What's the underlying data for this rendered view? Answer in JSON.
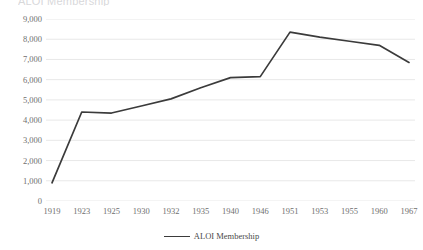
{
  "chart_title_partial": "ALOI Membership",
  "legend": {
    "entries": [
      {
        "label": "ALOI Membership",
        "color": "#3b3b3b",
        "marker": "line"
      }
    ]
  },
  "axes": {
    "y_ticks": [
      "0",
      "1,000",
      "2,000",
      "3,000",
      "4,000",
      "5,000",
      "6,000",
      "7,000",
      "8,000",
      "9,000"
    ],
    "x_ticks": [
      "1919",
      "1923",
      "1925",
      "1930",
      "1932",
      "1935",
      "1940",
      "1946",
      "1951",
      "1953",
      "1955",
      "1960",
      "1967"
    ]
  },
  "colors": {
    "line": "#3b3b3b",
    "gridline": "#e8e8e8",
    "tick_text": "#6f6f6f",
    "background": "#ffffff"
  },
  "chart_data": {
    "type": "line",
    "title": "ALOI Membership",
    "xlabel": "",
    "ylabel": "",
    "ylim": [
      0,
      9000
    ],
    "ytick_step": 1000,
    "grid": true,
    "legend_position": "bottom",
    "categories": [
      "1919",
      "1923",
      "1925",
      "1930",
      "1932",
      "1935",
      "1940",
      "1946",
      "1951",
      "1953",
      "1955",
      "1960",
      "1967"
    ],
    "series": [
      {
        "name": "ALOI Membership",
        "color": "#3b3b3b",
        "values": [
          900,
          4400,
          4350,
          4700,
          5050,
          5600,
          6100,
          6150,
          8350,
          8100,
          7900,
          7700,
          6850
        ]
      }
    ]
  }
}
